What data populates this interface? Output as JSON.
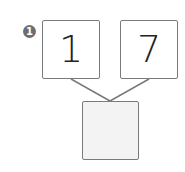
{
  "problem": {
    "number_badge": "1",
    "top_left_value": "1",
    "top_right_value": "7",
    "answer_value": ""
  },
  "colors": {
    "border": "#7a7a7a",
    "answer_fill": "#f3f3f3",
    "badge": "#6e6e6e"
  }
}
